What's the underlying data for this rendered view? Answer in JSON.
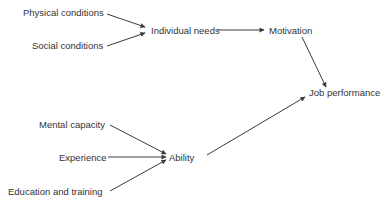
{
  "diagram": {
    "type": "flow-diagram",
    "nodes": {
      "physical_conditions": "Physical conditions",
      "social_conditions": "Social conditions",
      "individual_needs": "Individual needs",
      "motivation": "Motivation",
      "job_performance": "Job performance",
      "mental_capacity": "Mental capacity",
      "experience": "Experience",
      "education_training": "Education and training",
      "ability": "Ability"
    },
    "edges": [
      {
        "from": "Physical conditions",
        "to": "Individual needs"
      },
      {
        "from": "Social conditions",
        "to": "Individual needs"
      },
      {
        "from": "Individual needs",
        "to": "Motivation"
      },
      {
        "from": "Motivation",
        "to": "Job performance"
      },
      {
        "from": "Mental capacity",
        "to": "Ability"
      },
      {
        "from": "Experience",
        "to": "Ability"
      },
      {
        "from": "Education and training",
        "to": "Ability"
      },
      {
        "from": "Ability",
        "to": "Job performance"
      }
    ],
    "colors": {
      "text": "#333333",
      "line": "#3a3a3a",
      "background": "#ffffff"
    }
  }
}
